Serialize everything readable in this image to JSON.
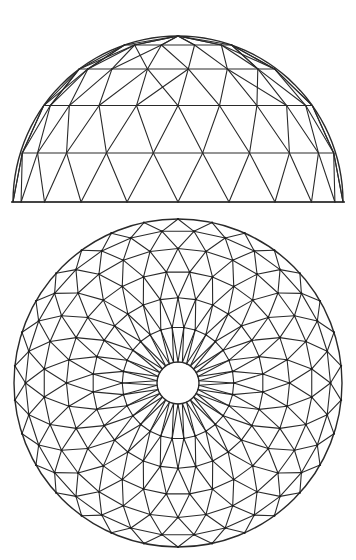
{
  "figure": {
    "stroke_color": "#2a2a2a",
    "background": "#ffffff"
  },
  "elevation": {
    "cx": 178,
    "base_y": 202,
    "radius_x": 165,
    "radius_y": 166,
    "frequency": 4,
    "segments": 20
  },
  "plan": {
    "cx": 178,
    "cy": 383,
    "radius": 164,
    "hole_radius": 21,
    "frequency": 5,
    "segments": 30
  }
}
